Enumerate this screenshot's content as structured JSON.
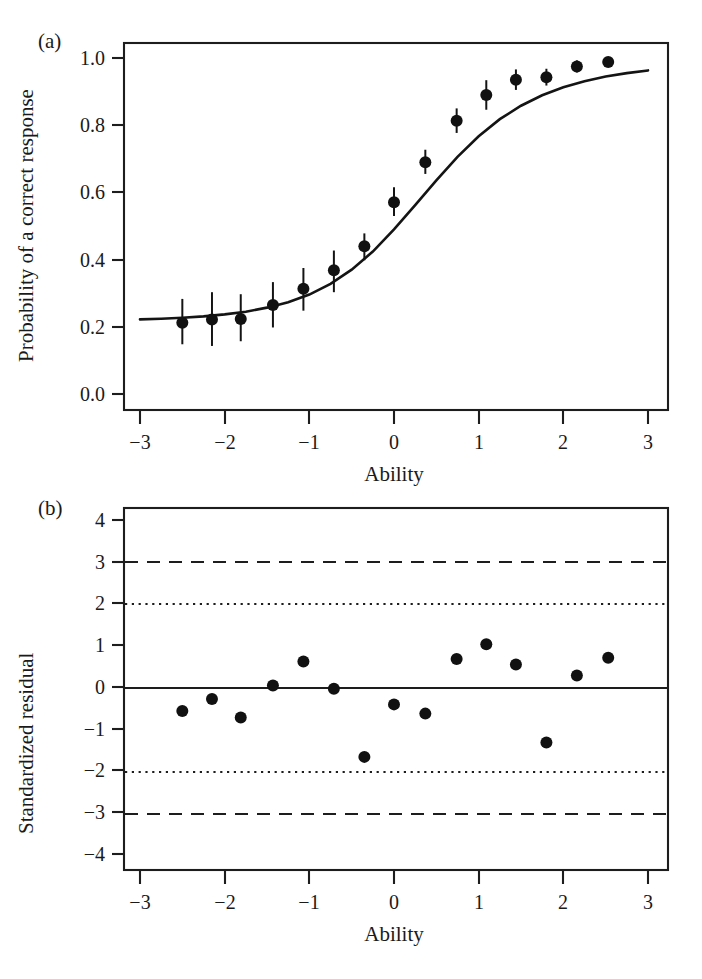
{
  "figure": {
    "panel_a_label": "(a)",
    "panel_b_label": "(b)"
  },
  "chart_data": [
    {
      "panel": "(a)",
      "type": "line",
      "title": "",
      "xlabel": "Ability",
      "ylabel": "Probability of a correct response",
      "xlim": [
        -3,
        3
      ],
      "ylim": [
        0.0,
        1.0
      ],
      "xticks": [
        -3,
        -2,
        -1,
        0,
        1,
        2,
        3
      ],
      "xticklabels": [
        "−3",
        "−2",
        "−1",
        "0",
        "1",
        "2",
        "3"
      ],
      "yticks": [
        0.0,
        0.2,
        0.4,
        0.6,
        0.8,
        1.0
      ],
      "yticklabels": [
        "0.0",
        "0.2",
        "0.4",
        "0.6",
        "0.8",
        "1.0"
      ],
      "grid": false,
      "legend": "none",
      "series": [
        {
          "name": "Fitted 3PL item characteristic curve",
          "type": "line",
          "model": "3PL logistic",
          "params": {
            "guessing": 0.22,
            "discrimination": 1.45,
            "difficulty": 0.05,
            "upper_asymptote": 1.0
          },
          "x": [
            -3.0,
            -2.75,
            -2.5,
            -2.25,
            -2.0,
            -1.75,
            -1.5,
            -1.25,
            -1.0,
            -0.75,
            -0.5,
            -0.25,
            0.0,
            0.25,
            0.5,
            0.75,
            1.0,
            1.25,
            1.5,
            1.75,
            2.0,
            2.25,
            2.5,
            2.75,
            3.0
          ],
          "y": [
            0.222,
            0.224,
            0.227,
            0.231,
            0.237,
            0.245,
            0.257,
            0.273,
            0.296,
            0.328,
            0.37,
            0.424,
            0.49,
            0.562,
            0.636,
            0.706,
            0.767,
            0.818,
            0.858,
            0.889,
            0.913,
            0.931,
            0.945,
            0.955,
            0.963
          ]
        },
        {
          "name": "Observed proportion correct by ability group",
          "type": "scatter-errorbar",
          "x": [
            -2.5,
            -2.15,
            -1.81,
            -1.43,
            -1.07,
            -0.71,
            -0.35,
            0.0,
            0.37,
            0.74,
            1.09,
            1.44,
            1.8,
            2.16,
            2.53
          ],
          "y": [
            0.212,
            0.222,
            0.223,
            0.265,
            0.313,
            0.368,
            0.44,
            0.571,
            0.69,
            0.813,
            0.89,
            0.935,
            0.943,
            0.975,
            0.988
          ],
          "yerr_low": [
            0.148,
            0.143,
            0.157,
            0.198,
            0.248,
            0.303,
            0.398,
            0.53,
            0.655,
            0.777,
            0.846,
            0.905,
            0.918,
            0.957,
            0.982
          ],
          "yerr_high": [
            0.283,
            0.303,
            0.297,
            0.333,
            0.375,
            0.427,
            0.478,
            0.615,
            0.727,
            0.85,
            0.934,
            0.966,
            0.968,
            0.993,
            0.996
          ]
        }
      ]
    },
    {
      "panel": "(b)",
      "type": "scatter",
      "title": "",
      "xlabel": "Ability",
      "ylabel": "Standardized residual",
      "xlim": [
        -3,
        3
      ],
      "ylim": [
        -4,
        4
      ],
      "xticks": [
        -3,
        -2,
        -1,
        0,
        1,
        2,
        3
      ],
      "xticklabels": [
        "−3",
        "−2",
        "−1",
        "0",
        "1",
        "2",
        "3"
      ],
      "yticks": [
        -4,
        -3,
        -2,
        -1,
        0,
        1,
        2,
        3,
        4
      ],
      "yticklabels": [
        "−4",
        "−3",
        "−2",
        "−1",
        "0",
        "1",
        "2",
        "3",
        "4"
      ],
      "grid": false,
      "legend": "none",
      "reference_lines": [
        {
          "y": 3,
          "style": "dashed"
        },
        {
          "y": 2,
          "style": "dotted"
        },
        {
          "y": 0,
          "style": "solid"
        },
        {
          "y": -2,
          "style": "dotted"
        },
        {
          "y": -3,
          "style": "dashed"
        }
      ],
      "series": [
        {
          "name": "Standardized residuals",
          "type": "scatter",
          "x": [
            -2.5,
            -2.15,
            -1.81,
            -1.43,
            -1.07,
            -0.71,
            -0.35,
            0.0,
            0.37,
            0.74,
            1.09,
            1.44,
            1.8,
            2.16,
            2.53
          ],
          "y": [
            -0.55,
            -0.26,
            -0.7,
            0.06,
            0.63,
            -0.02,
            -1.64,
            -0.39,
            -0.61,
            0.69,
            1.04,
            0.56,
            -1.3,
            0.3,
            0.72
          ]
        }
      ]
    }
  ]
}
